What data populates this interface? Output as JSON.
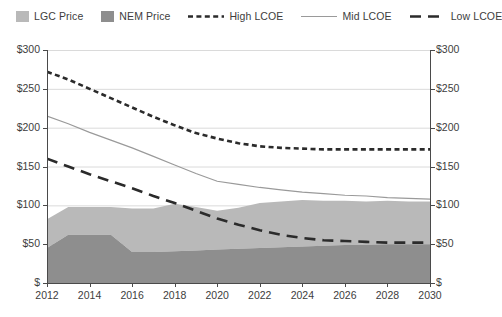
{
  "legend": {
    "items": [
      {
        "label": "LGC Price",
        "marker": "area-swatch-light",
        "color": "#b9b9b9"
      },
      {
        "label": "NEM Price",
        "marker": "area-swatch-dark",
        "color": "#8e8e8e"
      },
      {
        "label": "High LCOE",
        "marker": "short-dash-line",
        "color": "#2b2b2b"
      },
      {
        "label": "Mid LCOE",
        "marker": "solid-line",
        "color": "#9a9a9a"
      },
      {
        "label": "Low LCOE",
        "marker": "long-dash-line",
        "color": "#2b2b2b"
      }
    ]
  },
  "axes": {
    "y_ticks": [
      "$300",
      "$250",
      "$200",
      "$150",
      "$100",
      "$50",
      "$"
    ],
    "x_ticks": [
      "2012",
      "2014",
      "2016",
      "2018",
      "2020",
      "2022",
      "2024",
      "2026",
      "2028",
      "2030"
    ]
  },
  "chart_data": {
    "type": "area",
    "title": "",
    "xlabel": "",
    "ylabel": "",
    "ylim": [
      0,
      300
    ],
    "xlim": [
      2012,
      2030
    ],
    "grid": true,
    "legend_position": "top",
    "dual_y_axis": true,
    "x": [
      2012,
      2013,
      2014,
      2015,
      2016,
      2017,
      2018,
      2019,
      2020,
      2021,
      2022,
      2023,
      2024,
      2025,
      2026,
      2027,
      2028,
      2029,
      2030
    ],
    "series": [
      {
        "name": "NEM Price",
        "type": "area-stacked",
        "color": "#8e8e8e",
        "values": [
          45,
          62,
          62,
          62,
          40,
          40,
          41,
          42,
          43,
          44,
          45,
          46,
          47,
          48,
          49,
          49,
          50,
          50,
          50
        ]
      },
      {
        "name": "LGC Price",
        "type": "area-stacked",
        "color": "#b9b9b9",
        "values": [
          37,
          36,
          36,
          36,
          56,
          56,
          61,
          56,
          50,
          53,
          58,
          59,
          60,
          58,
          57,
          56,
          56,
          55,
          55
        ]
      },
      {
        "name": "High LCOE",
        "type": "line",
        "style": "short-dash",
        "color": "#2b2b2b",
        "values": [
          272,
          262,
          250,
          238,
          226,
          214,
          203,
          193,
          186,
          180,
          176,
          174,
          173,
          172,
          172,
          172,
          172,
          172,
          172
        ]
      },
      {
        "name": "Mid LCOE",
        "type": "line",
        "style": "solid",
        "color": "#9a9a9a",
        "values": [
          215,
          205,
          194,
          184,
          174,
          163,
          152,
          141,
          131,
          127,
          123,
          120,
          117,
          115,
          113,
          112,
          110,
          109,
          108
        ]
      },
      {
        "name": "Low LCOE",
        "type": "line",
        "style": "long-dash",
        "color": "#2b2b2b",
        "values": [
          160,
          150,
          140,
          131,
          122,
          112,
          103,
          93,
          83,
          75,
          68,
          62,
          58,
          55,
          54,
          53,
          52,
          52,
          52
        ]
      }
    ],
    "stacked_totals": [
      82,
      98,
      98,
      98,
      96,
      96,
      102,
      98,
      93,
      97,
      103,
      105,
      107,
      106,
      106,
      105,
      106,
      105,
      105
    ]
  }
}
